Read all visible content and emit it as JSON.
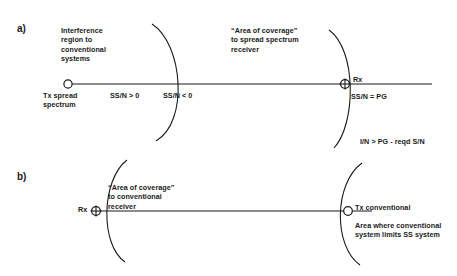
{
  "figure": {
    "panels": [
      {
        "tag": "a)",
        "annotations": {
          "left": "Interference\nregion to\nconventional\nsystems",
          "right": "“Area of coverage”\nto spread spectrum\nreceiver"
        },
        "nodes": {
          "tx_label": "Tx spread\nspectrum",
          "rx_label": "Rx"
        },
        "conditions": {
          "inner": "SS/N > 0",
          "outer": "SS/N < 0",
          "at_receiver": "SS/N = PG",
          "interference": "I/N > PG - reqd S/N"
        }
      },
      {
        "tag": "b)",
        "annotations": {
          "left": "“Area of coverage”\nto conventional\nreceiver",
          "right": "Area where conventional\nsystem limits SS system"
        },
        "nodes": {
          "rx_label": "Rx",
          "tx_label": "Tx conventional"
        }
      }
    ],
    "style": {
      "line_color": "#1a1a1a",
      "text_color": "#1a1a1a",
      "background": "#ffffff"
    }
  }
}
